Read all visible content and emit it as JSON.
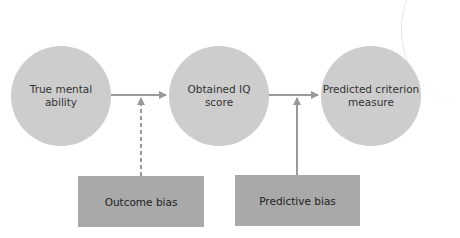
{
  "diagram": {
    "nodes": [
      {
        "id": "true-mental-ability",
        "label": "True mental ability",
        "line1": "True mental",
        "line2": "ability",
        "shape": "circle"
      },
      {
        "id": "obtained-iq-score",
        "label": "Obtained IQ score",
        "line1": "Obtained IQ",
        "line2": "score",
        "shape": "circle"
      },
      {
        "id": "predicted-criterion-measure",
        "label": "Predicted criterion measure",
        "line1": "Predicted criterion",
        "line2": "measure",
        "shape": "circle"
      },
      {
        "id": "outcome-bias",
        "label": "Outcome bias",
        "shape": "rectangle"
      },
      {
        "id": "predictive-bias",
        "label": "Predictive bias",
        "shape": "rectangle"
      }
    ],
    "edges": [
      {
        "from": "true-mental-ability",
        "to": "obtained-iq-score",
        "style": "solid"
      },
      {
        "from": "obtained-iq-score",
        "to": "predicted-criterion-measure",
        "style": "solid"
      },
      {
        "from": "outcome-bias",
        "to": "edge:true-mental-ability->obtained-iq-score",
        "style": "dashed"
      },
      {
        "from": "predictive-bias",
        "to": "edge:obtained-iq-score->predicted-criterion-measure",
        "style": "solid"
      }
    ],
    "colors": {
      "circle_fill": "#cdcdcd",
      "box_fill": "#a9a9a9",
      "arrow": "#999999",
      "text": "#333333"
    }
  }
}
